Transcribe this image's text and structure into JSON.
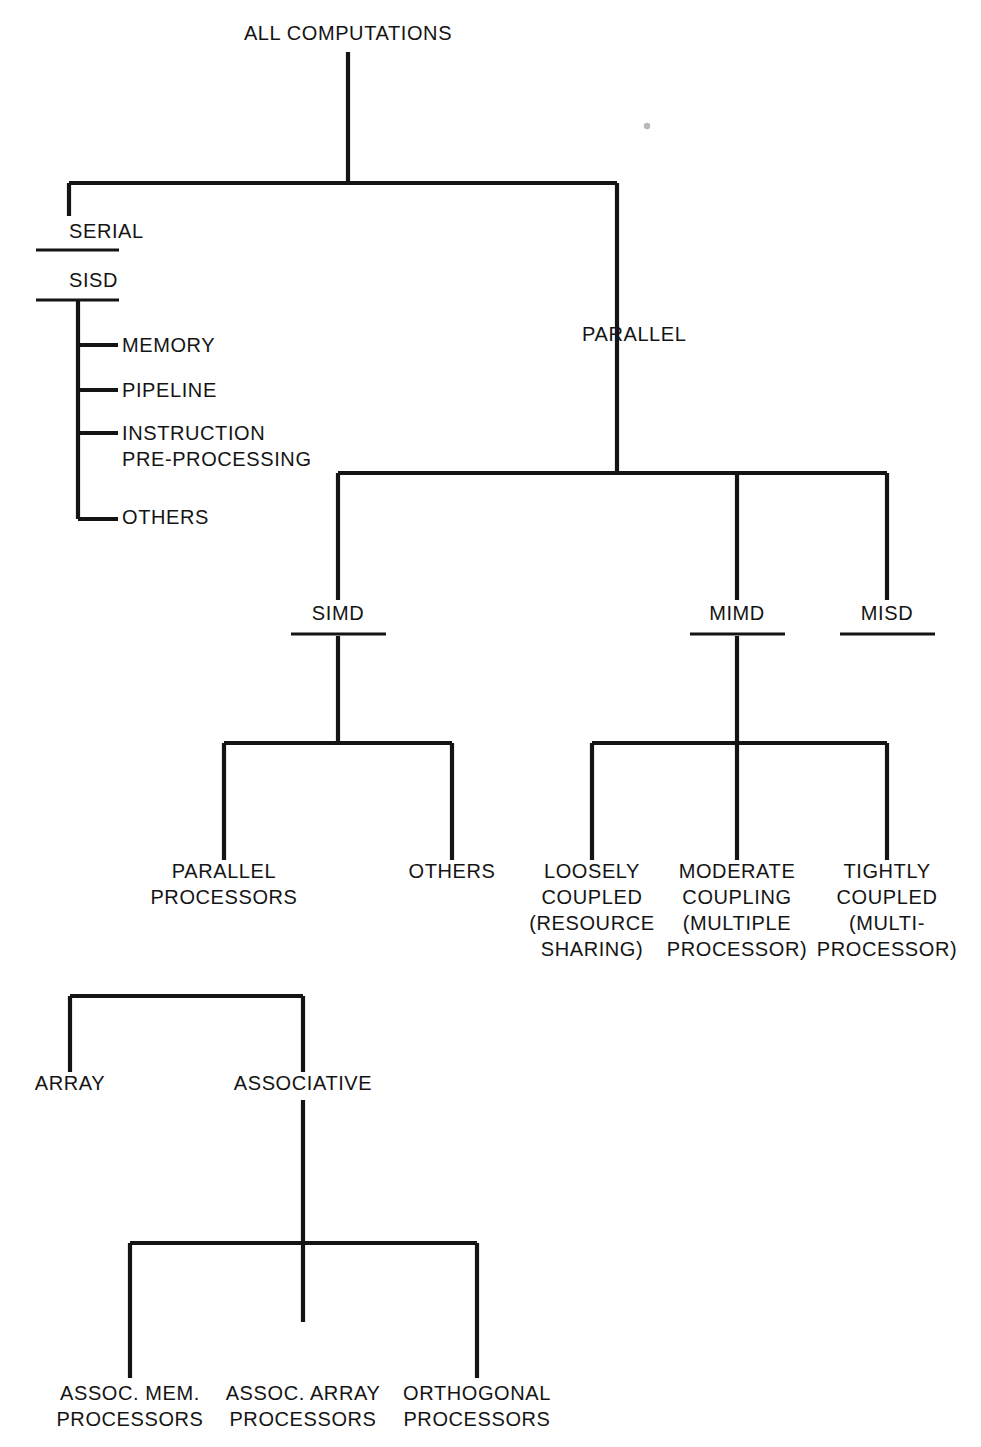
{
  "diagram": {
    "title": "ALL COMPUTATIONS",
    "type": "tree-taxonomy",
    "orientation": "top-down",
    "colors": {
      "background": "#ffffff",
      "line": "#141414",
      "text": "#141414",
      "artifact": "#b9b9b9"
    },
    "nodes": [
      {
        "id": "all",
        "label": "ALL COMPUTATIONS",
        "x": 348,
        "y": 40,
        "anchor": "middle",
        "rule": "none",
        "lines": [
          "ALL COMPUTATIONS"
        ]
      },
      {
        "id": "serial",
        "label": "SERIAL",
        "x": 69,
        "y": 238,
        "anchor": "start",
        "rule": "under",
        "lines": [
          "SERIAL"
        ]
      },
      {
        "id": "sisd",
        "label": "SISD",
        "x": 69,
        "y": 287,
        "anchor": "start",
        "rule": "under",
        "lines": [
          "SISD"
        ]
      },
      {
        "id": "parallel",
        "label": "PARALLEL",
        "x": 582,
        "y": 341,
        "anchor": "start",
        "rule": "none",
        "lines": [
          "PARALLEL"
        ]
      },
      {
        "id": "memory",
        "label": "MEMORY",
        "x": 122,
        "y": 352,
        "anchor": "start",
        "rule": "none",
        "lines": [
          "MEMORY"
        ]
      },
      {
        "id": "pipeline",
        "label": "PIPELINE",
        "x": 122,
        "y": 397,
        "anchor": "start",
        "rule": "none",
        "lines": [
          "PIPELINE"
        ]
      },
      {
        "id": "instruction",
        "label": "INSTRUCTION PRE-PROCESSING",
        "x": 122,
        "y": 440,
        "anchor": "start",
        "rule": "none",
        "lines": [
          "INSTRUCTION",
          "PRE-PROCESSING"
        ]
      },
      {
        "id": "sisd-others",
        "label": "OTHERS",
        "x": 122,
        "y": 524,
        "anchor": "start",
        "rule": "none",
        "lines": [
          "OTHERS"
        ]
      },
      {
        "id": "simd",
        "label": "SIMD",
        "x": 338,
        "y": 620,
        "anchor": "middle",
        "rule": "under",
        "lines": [
          "SIMD"
        ]
      },
      {
        "id": "mimd",
        "label": "MIMD",
        "x": 737,
        "y": 620,
        "anchor": "middle",
        "rule": "under",
        "lines": [
          "MIMD"
        ]
      },
      {
        "id": "misd",
        "label": "MISD",
        "x": 887,
        "y": 620,
        "anchor": "middle",
        "rule": "under",
        "lines": [
          "MISD"
        ]
      },
      {
        "id": "parallel-proc",
        "label": "PARALLEL PROCESSORS",
        "x": 224,
        "y": 878,
        "anchor": "middle",
        "rule": "none",
        "lines": [
          "PARALLEL",
          "PROCESSORS"
        ]
      },
      {
        "id": "simd-others",
        "label": "OTHERS",
        "x": 452,
        "y": 878,
        "anchor": "middle",
        "rule": "none",
        "lines": [
          "OTHERS"
        ]
      },
      {
        "id": "loosely",
        "label": "LOOSELY COUPLED (RESOURCE SHARING)",
        "x": 592,
        "y": 878,
        "anchor": "middle",
        "rule": "none",
        "lines": [
          "LOOSELY",
          "COUPLED",
          "(RESOURCE",
          "SHARING)"
        ]
      },
      {
        "id": "moderate",
        "label": "MODERATE COUPLING (MULTIPLE PROCESSOR)",
        "x": 737,
        "y": 878,
        "anchor": "middle",
        "rule": "none",
        "lines": [
          "MODERATE",
          "COUPLING",
          "(MULTIPLE",
          "PROCESSOR)"
        ]
      },
      {
        "id": "tightly",
        "label": "TIGHTLY COUPLED (MULTI-PROCESSOR)",
        "x": 887,
        "y": 878,
        "anchor": "middle",
        "rule": "none",
        "lines": [
          "TIGHTLY",
          "COUPLED",
          "(MULTI-",
          "PROCESSOR)"
        ]
      },
      {
        "id": "array",
        "label": "ARRAY",
        "x": 70,
        "y": 1090,
        "anchor": "middle",
        "rule": "none",
        "lines": [
          "ARRAY"
        ]
      },
      {
        "id": "associative",
        "label": "ASSOCIATIVE",
        "x": 303,
        "y": 1090,
        "anchor": "middle",
        "rule": "none",
        "lines": [
          "ASSOCIATIVE"
        ]
      },
      {
        "id": "assoc-mem",
        "label": "ASSOC. MEM. PROCESSORS",
        "x": 130,
        "y": 1400,
        "anchor": "middle",
        "rule": "none",
        "lines": [
          "ASSOC. MEM.",
          "PROCESSORS"
        ]
      },
      {
        "id": "assoc-array",
        "label": "ASSOC. ARRAY PROCESSORS",
        "x": 303,
        "y": 1400,
        "anchor": "middle",
        "rule": "none",
        "lines": [
          "ASSOC. ARRAY",
          "PROCESSORS"
        ]
      },
      {
        "id": "orthogonal",
        "label": "ORTHOGONAL PROCESSORS",
        "x": 477,
        "y": 1400,
        "anchor": "middle",
        "rule": "none",
        "lines": [
          "ORTHOGONAL",
          "PROCESSORS"
        ]
      }
    ],
    "edges": [
      {
        "id": "trunk-all",
        "from": "all",
        "to": "split-1",
        "d": "M348,52 L348,183"
      },
      {
        "id": "split-1-bar",
        "from": "split-1",
        "to": "serial|parallel",
        "d": "M69,183 L617,183"
      },
      {
        "id": "branch-serial",
        "from": "split-1",
        "to": "serial",
        "d": "M69,183 L69,216"
      },
      {
        "id": "branch-parallel",
        "from": "split-1",
        "to": "parallel",
        "d": "M617,183 L617,473"
      },
      {
        "id": "sisd-spine",
        "from": "sisd",
        "to": "sisd-children",
        "d": "M78,300 L78,519"
      },
      {
        "id": "sisd-memory",
        "from": "sisd",
        "to": "memory",
        "d": "M78,345 L118,345"
      },
      {
        "id": "sisd-pipeline",
        "from": "sisd",
        "to": "pipeline",
        "d": "M78,390 L118,390"
      },
      {
        "id": "sisd-instruction",
        "from": "sisd",
        "to": "instruction",
        "d": "M78,433 L118,433"
      },
      {
        "id": "sisd-others",
        "from": "sisd",
        "to": "sisd-others",
        "d": "M78,519 L118,519"
      },
      {
        "id": "split-2-bar",
        "from": "parallel",
        "to": "simd|mimd|misd",
        "d": "M338,473 L887,473"
      },
      {
        "id": "branch-simd",
        "from": "split-2",
        "to": "simd",
        "d": "M338,473 L338,600"
      },
      {
        "id": "branch-mimd",
        "from": "split-2",
        "to": "mimd",
        "d": "M737,473 L737,600"
      },
      {
        "id": "branch-misd",
        "from": "split-2",
        "to": "misd",
        "d": "M887,473 L887,600"
      },
      {
        "id": "simd-stem",
        "from": "simd",
        "to": "split-3",
        "d": "M338,636 L338,743"
      },
      {
        "id": "split-3-bar",
        "from": "split-3",
        "to": "parallel-proc|simd-others",
        "d": "M224,743 L452,743"
      },
      {
        "id": "branch-par-proc",
        "from": "split-3",
        "to": "parallel-proc",
        "d": "M224,743 L224,860"
      },
      {
        "id": "branch-simd-oth",
        "from": "split-3",
        "to": "simd-others",
        "d": "M452,743 L452,860"
      },
      {
        "id": "mimd-stem",
        "from": "mimd",
        "to": "split-4",
        "d": "M737,636 L737,743"
      },
      {
        "id": "split-4-bar",
        "from": "split-4",
        "to": "loosely|moderate|tightly",
        "d": "M592,743 L887,743"
      },
      {
        "id": "branch-loosely",
        "from": "split-4",
        "to": "loosely",
        "d": "M592,743 L592,860"
      },
      {
        "id": "branch-moderate",
        "from": "split-4",
        "to": "moderate",
        "d": "M737,743 L737,860"
      },
      {
        "id": "branch-tightly",
        "from": "split-4",
        "to": "tightly",
        "d": "M887,743 L887,860"
      },
      {
        "id": "split-5-bar",
        "from": "simd-group",
        "to": "array|associative",
        "d": "M70,996 L303,996"
      },
      {
        "id": "branch-array",
        "from": "split-5",
        "to": "array",
        "d": "M70,996 L70,1072"
      },
      {
        "id": "branch-assoc",
        "from": "split-5",
        "to": "associative",
        "d": "M303,996 L303,1072"
      },
      {
        "id": "assoc-stem",
        "from": "associative",
        "to": "split-6",
        "d": "M303,1100 L303,1322"
      },
      {
        "id": "split-6-bar",
        "from": "split-6",
        "to": "assoc-mem|assoc-array|orthogonal",
        "d": "M130,1243 L477,1243"
      },
      {
        "id": "branch-assoc-mem",
        "from": "split-6",
        "to": "assoc-mem",
        "d": "M130,1243 L130,1378"
      },
      {
        "id": "branch-orthogonal",
        "from": "split-6",
        "to": "orthogonal",
        "d": "M477,1243 L477,1378"
      }
    ],
    "rules": [
      {
        "id": "rule-serial",
        "for": "serial",
        "d": "M36,250 L119,250"
      },
      {
        "id": "rule-sisd",
        "for": "sisd",
        "d": "M36,300 L119,300"
      },
      {
        "id": "rule-simd",
        "for": "simd",
        "d": "M291,634 L386,634"
      },
      {
        "id": "rule-mimd",
        "for": "mimd",
        "d": "M690,634 L785,634"
      },
      {
        "id": "rule-misd",
        "for": "misd",
        "d": "M840,634 L935,634"
      }
    ],
    "artifacts": [
      {
        "id": "speck-1",
        "cx": 647,
        "cy": 126,
        "r": 3.2
      }
    ]
  }
}
